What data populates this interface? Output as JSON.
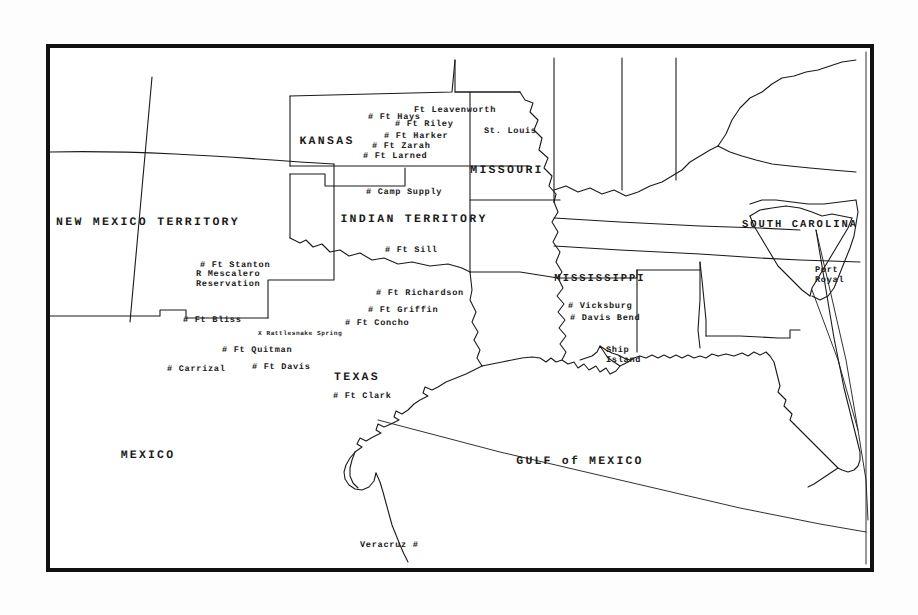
{
  "map": {
    "title": "Historical map of the American Southwest, Indian Territory and Gulf of Mexico",
    "frame_color": "#111111",
    "ink_color": "#1a1a1a",
    "paper_color": "#ffffff"
  },
  "regions": [
    {
      "name": "new-mexico-territory",
      "label": "NEW MEXICO TERRITORY",
      "x": 148,
      "y": 222,
      "style": "region"
    },
    {
      "name": "kansas",
      "label": "KANSAS",
      "x": 327,
      "y": 141,
      "style": "region"
    },
    {
      "name": "missouri",
      "label": "MISSOURI",
      "x": 507,
      "y": 170,
      "style": "region"
    },
    {
      "name": "indian-territory",
      "label": "INDIAN TERRITORY",
      "x": 414,
      "y": 219,
      "style": "region"
    },
    {
      "name": "mississippi",
      "label": "MISSISSIPPI",
      "x": 600,
      "y": 279,
      "style": "region-sm"
    },
    {
      "name": "south-carolina",
      "label": "SOUTH CAROLINA",
      "x": 800,
      "y": 225,
      "style": "region-sm"
    },
    {
      "name": "texas",
      "label": "TEXAS",
      "x": 357,
      "y": 377,
      "style": "region"
    },
    {
      "name": "mexico",
      "label": "MEXICO",
      "x": 148,
      "y": 455,
      "style": "water"
    },
    {
      "name": "gulf-of-mexico",
      "label": "GULF of MEXICO",
      "x": 580,
      "y": 461,
      "style": "water"
    }
  ],
  "places": [
    {
      "name": "ft-leavenworth",
      "label": "Ft Leavenworth",
      "marker": "",
      "x": 414,
      "y": 110,
      "anchor": "left"
    },
    {
      "name": "ft-hays",
      "label": "# Ft Hays",
      "marker": "#",
      "x": 368,
      "y": 117,
      "anchor": "left"
    },
    {
      "name": "ft-riley",
      "label": "# Ft Riley",
      "marker": "#",
      "x": 395,
      "y": 124,
      "anchor": "left"
    },
    {
      "name": "ft-harker",
      "label": "# Ft Harker",
      "marker": "#",
      "x": 384,
      "y": 136,
      "anchor": "left"
    },
    {
      "name": "ft-zarah",
      "label": "# Ft Zarah",
      "marker": "#",
      "x": 372,
      "y": 146,
      "anchor": "left"
    },
    {
      "name": "ft-larned",
      "label": "# Ft Larned",
      "marker": "#",
      "x": 363,
      "y": 156,
      "anchor": "left"
    },
    {
      "name": "st-louis",
      "label": "St. Louis",
      "marker": "",
      "x": 484,
      "y": 131,
      "anchor": "left"
    },
    {
      "name": "camp-supply",
      "label": "# Camp Supply",
      "marker": "#",
      "x": 366,
      "y": 192,
      "anchor": "left"
    },
    {
      "name": "ft-sill",
      "label": "# Ft Sill",
      "marker": "#",
      "x": 385,
      "y": 250,
      "anchor": "left"
    },
    {
      "name": "ft-stanton",
      "label": "# Ft Stanton",
      "marker": "#",
      "x": 200,
      "y": 265,
      "anchor": "left"
    },
    {
      "name": "ft-richardson",
      "label": "# Ft Richardson",
      "marker": "#",
      "x": 376,
      "y": 293,
      "anchor": "left"
    },
    {
      "name": "ft-griffin",
      "label": "# Ft Griffin",
      "marker": "#",
      "x": 368,
      "y": 310,
      "anchor": "left"
    },
    {
      "name": "ft-concho",
      "label": "# Ft Concho",
      "marker": "#",
      "x": 345,
      "y": 323,
      "anchor": "left"
    },
    {
      "name": "ft-bliss",
      "label": "# Ft Bliss",
      "marker": "#",
      "x": 183,
      "y": 320,
      "anchor": "left"
    },
    {
      "name": "ft-quitman",
      "label": "# Ft Quitman",
      "marker": "#",
      "x": 222,
      "y": 350,
      "anchor": "left"
    },
    {
      "name": "carrizal",
      "label": "# Carrizal",
      "marker": "#",
      "x": 167,
      "y": 369,
      "anchor": "left"
    },
    {
      "name": "ft-davis",
      "label": "# Ft Davis",
      "marker": "#",
      "x": 252,
      "y": 367,
      "anchor": "left"
    },
    {
      "name": "ft-clark",
      "label": "# Ft Clark",
      "marker": "#",
      "x": 333,
      "y": 396,
      "anchor": "left"
    },
    {
      "name": "vicksburg",
      "label": "# Vicksburg",
      "marker": "#",
      "x": 568,
      "y": 306,
      "anchor": "left"
    },
    {
      "name": "davis-bend",
      "label": "# Davis Bend",
      "marker": "#",
      "x": 570,
      "y": 318,
      "anchor": "left"
    },
    {
      "name": "veracruz",
      "label": "Veracruz #",
      "marker": "#",
      "x": 360,
      "y": 545,
      "anchor": "left"
    }
  ],
  "stacked_places": [
    {
      "name": "mescalero-reservation",
      "lines": [
        "R Mescalero",
        "Reservation"
      ],
      "x": 196,
      "y": 279
    },
    {
      "name": "port-royal",
      "lines": [
        "Port",
        "Royal"
      ],
      "x": 815,
      "y": 275
    },
    {
      "name": "ship-island",
      "lines": [
        "Ship",
        "Island"
      ],
      "x": 606,
      "y": 355
    }
  ],
  "tiny_places": [
    {
      "name": "rattlesnake-spring",
      "label": "X Rattlesnake Spring",
      "x": 258,
      "y": 333
    }
  ]
}
